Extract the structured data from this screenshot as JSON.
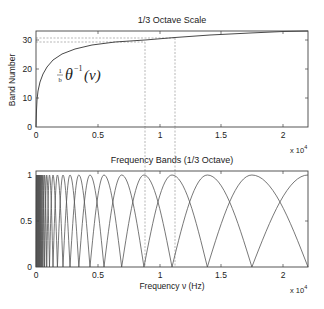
{
  "chart_data": [
    {
      "type": "line",
      "title": "1/3 Octave Scale",
      "xlabel": "",
      "ylabel": "Band Number",
      "x_multiplier": "x 10^4",
      "xlim": [
        0,
        2.205
      ],
      "ylim": [
        0,
        33
      ],
      "x_ticks": [
        "0",
        "0.5",
        "1",
        "1.5",
        "2"
      ],
      "y_ticks": [
        "0",
        "10",
        "20",
        "30"
      ],
      "annotation": "(1/b) θ^-1(ν)",
      "series": [
        {
          "name": "band number vs frequency",
          "x": [
            0.0,
            0.002,
            0.005,
            0.01,
            0.02,
            0.05,
            0.1,
            0.2,
            0.3,
            0.5,
            0.7,
            0.9,
            1.1,
            1.4,
            1.8,
            2.2
          ],
          "y": [
            0,
            5,
            9,
            12,
            15,
            19,
            22,
            25,
            27,
            29,
            30.5,
            31.5,
            32.3,
            33.3,
            34.4,
            35.3
          ]
        }
      ],
      "reference_lines": {
        "horizontal_dashed_y": [
          29.3,
          30.3
        ],
        "vertical_dashed_x": [
          0.89,
          1.12
        ]
      },
      "grid": false
    },
    {
      "type": "line",
      "title": "Frequency Bands (1/3 Octave)",
      "xlabel": "Frequency ν (Hz)",
      "ylabel": "",
      "x_multiplier": "x 10^4",
      "xlim": [
        0,
        2.205
      ],
      "ylim": [
        0,
        1
      ],
      "x_ticks": [
        "0",
        "0.5",
        "1",
        "1.5",
        "2"
      ],
      "y_ticks": [
        "0",
        "0.5",
        "1"
      ],
      "description": "Overlapping triangular/sinusoidal band filters; peak centers spaced on a 1/3-octave (log) scale, becoming dense near 0",
      "band_peaks_x": [
        0.07,
        0.09,
        0.11,
        0.14,
        0.18,
        0.22,
        0.28,
        0.35,
        0.44,
        0.56,
        0.7,
        0.89,
        1.12,
        1.41,
        1.78,
        2.2
      ],
      "band_zeros_x": [
        0.45,
        0.56,
        0.7,
        0.89,
        1.12,
        1.41,
        1.78,
        2.2
      ],
      "reference_lines": {
        "vertical_dashed_x": [
          0.89,
          1.12
        ]
      },
      "grid": false
    }
  ],
  "top": {
    "title": "1/3 Octave Scale",
    "ylabel": "Band Number",
    "annotation_frac": "1",
    "annotation_den": "b",
    "annotation_main": "θ",
    "annotation_sup": "−1",
    "annotation_arg": "(ν)",
    "yticks": [
      "0",
      "10",
      "20",
      "30"
    ],
    "xticks": [
      "0",
      "0.5",
      "1",
      "1.5",
      "2"
    ],
    "multiplier_base": "x 10",
    "multiplier_exp": "4"
  },
  "bottom": {
    "title": "Frequency Bands (1/3 Octave)",
    "xlabel": "Frequency ν (Hz)",
    "yticks": [
      "0",
      "0.5",
      "1"
    ],
    "xticks": [
      "0",
      "0.5",
      "1",
      "1.5",
      "2"
    ],
    "multiplier_base": "x 10",
    "multiplier_exp": "4"
  }
}
